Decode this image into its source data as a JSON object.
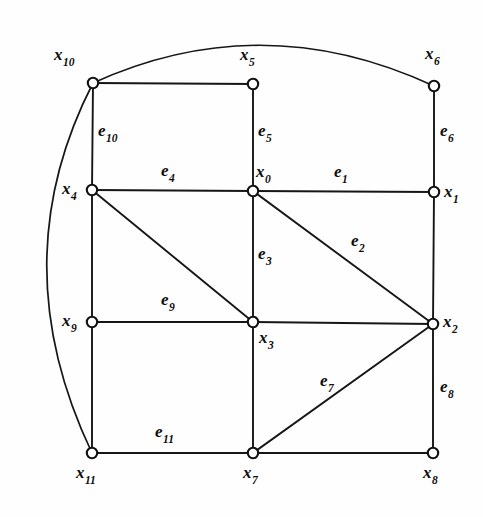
{
  "figure": {
    "type": "undirected-graph-diagram",
    "background_color": "#fefefe",
    "stroke_color": "#161616",
    "vertex_fill": "#ffffff",
    "width": 483,
    "height": 517
  },
  "vertices": [
    {
      "id": "x0",
      "base": "x",
      "sub": "0",
      "x": 253,
      "y": 191,
      "label_x": 256,
      "label_y": 163,
      "label_anchor": "above-right"
    },
    {
      "id": "x1",
      "base": "x",
      "sub": "1",
      "x": 434,
      "y": 192,
      "label_x": 444,
      "label_y": 183,
      "label_anchor": "right"
    },
    {
      "id": "x2",
      "base": "x",
      "sub": "2",
      "x": 433,
      "y": 324,
      "label_x": 443,
      "label_y": 313,
      "label_anchor": "right"
    },
    {
      "id": "x3",
      "base": "x",
      "sub": "3",
      "x": 253,
      "y": 322,
      "label_x": 259,
      "label_y": 329,
      "label_anchor": "below-right"
    },
    {
      "id": "x4",
      "base": "x",
      "sub": "4",
      "x": 92,
      "y": 190,
      "label_x": 62,
      "label_y": 180,
      "label_anchor": "left"
    },
    {
      "id": "x5",
      "base": "x",
      "sub": "5",
      "x": 253,
      "y": 84,
      "label_x": 240,
      "label_y": 46,
      "label_anchor": "above"
    },
    {
      "id": "x6",
      "base": "x",
      "sub": "6",
      "x": 434,
      "y": 86,
      "label_x": 425,
      "label_y": 45,
      "label_anchor": "above"
    },
    {
      "id": "x7",
      "base": "x",
      "sub": "7",
      "x": 253,
      "y": 453,
      "label_x": 243,
      "label_y": 464,
      "label_anchor": "below"
    },
    {
      "id": "x8",
      "base": "x",
      "sub": "8",
      "x": 433,
      "y": 453,
      "label_x": 423,
      "label_y": 464,
      "label_anchor": "below"
    },
    {
      "id": "x9",
      "base": "x",
      "sub": "9",
      "x": 92,
      "y": 322,
      "label_x": 62,
      "label_y": 312,
      "label_anchor": "left"
    },
    {
      "id": "x10",
      "base": "x",
      "sub": "10",
      "x": 93,
      "y": 83,
      "label_x": 54,
      "label_y": 46,
      "label_anchor": "above-left"
    },
    {
      "id": "x11",
      "base": "x",
      "sub": "11",
      "x": 92,
      "y": 453,
      "label_x": 76,
      "label_y": 464,
      "label_anchor": "below"
    }
  ],
  "edges": [
    {
      "id": "e1",
      "base": "e",
      "sub": "1",
      "from": "x0",
      "to": "x1",
      "shape": "straight",
      "label_x": 334,
      "label_y": 163
    },
    {
      "id": "e2",
      "base": "e",
      "sub": "2",
      "from": "x0",
      "to": "x2",
      "shape": "straight",
      "label_x": 351,
      "label_y": 232
    },
    {
      "id": "e3",
      "base": "e",
      "sub": "3",
      "from": "x0",
      "to": "x3",
      "shape": "straight",
      "label_x": 258,
      "label_y": 245
    },
    {
      "id": "e4",
      "base": "e",
      "sub": "4",
      "from": "x0",
      "to": "x4",
      "shape": "straight",
      "label_x": 161,
      "label_y": 162
    },
    {
      "id": "e5",
      "base": "e",
      "sub": "5",
      "from": "x0",
      "to": "x5",
      "shape": "straight",
      "label_x": 258,
      "label_y": 122
    },
    {
      "id": "e6",
      "base": "e",
      "sub": "6",
      "from": "x6",
      "to": "x1",
      "shape": "straight",
      "label_x": 440,
      "label_y": 122
    },
    {
      "id": "e7",
      "base": "e",
      "sub": "7",
      "from": "x7",
      "to": "x2",
      "shape": "straight",
      "label_x": 320,
      "label_y": 372
    },
    {
      "id": "e8",
      "base": "e",
      "sub": "8",
      "from": "x2",
      "to": "x8",
      "shape": "straight",
      "label_x": 440,
      "label_y": 378
    },
    {
      "id": "e9",
      "base": "e",
      "sub": "9",
      "from": "x9",
      "to": "x3",
      "shape": "straight",
      "label_x": 161,
      "label_y": 291
    },
    {
      "id": "e10",
      "base": "e",
      "sub": "10",
      "from": "x10",
      "to": "x4",
      "shape": "straight",
      "label_x": 98,
      "label_y": 122
    },
    {
      "id": "e11",
      "base": "e",
      "sub": "11",
      "from": "x11",
      "to": "x7",
      "shape": "straight",
      "label_x": 155,
      "label_y": 423
    },
    {
      "id": "u1",
      "base": "",
      "sub": "",
      "from": "x10",
      "to": "x5",
      "shape": "straight",
      "label_x": null,
      "label_y": null
    },
    {
      "id": "u2",
      "base": "",
      "sub": "",
      "from": "x4",
      "to": "x3",
      "shape": "straight",
      "label_x": null,
      "label_y": null
    },
    {
      "id": "u3",
      "base": "",
      "sub": "",
      "from": "x3",
      "to": "x2",
      "shape": "straight",
      "label_x": null,
      "label_y": null
    },
    {
      "id": "u4",
      "base": "",
      "sub": "",
      "from": "x1",
      "to": "x2",
      "shape": "straight",
      "label_x": null,
      "label_y": null
    },
    {
      "id": "u5",
      "base": "",
      "sub": "",
      "from": "x4",
      "to": "x9",
      "shape": "straight",
      "label_x": null,
      "label_y": null
    },
    {
      "id": "u6",
      "base": "",
      "sub": "",
      "from": "x9",
      "to": "x11",
      "shape": "straight",
      "label_x": null,
      "label_y": null
    },
    {
      "id": "u7",
      "base": "",
      "sub": "",
      "from": "x3",
      "to": "x7",
      "shape": "straight",
      "label_x": null,
      "label_y": null
    },
    {
      "id": "u8",
      "base": "",
      "sub": "",
      "from": "x7",
      "to": "x8",
      "shape": "straight",
      "label_x": null,
      "label_y": null
    },
    {
      "id": "arc_top",
      "base": "",
      "sub": "",
      "from": "x10",
      "to": "x6",
      "shape": "arc",
      "path": "M 93 83 Q 262 6 434 86",
      "label_x": null,
      "label_y": null
    },
    {
      "id": "arc_left",
      "base": "",
      "sub": "",
      "from": "x10",
      "to": "x11",
      "shape": "arc",
      "path": "M 93 83 Q 1 262 92 453",
      "label_x": null,
      "label_y": null
    }
  ]
}
